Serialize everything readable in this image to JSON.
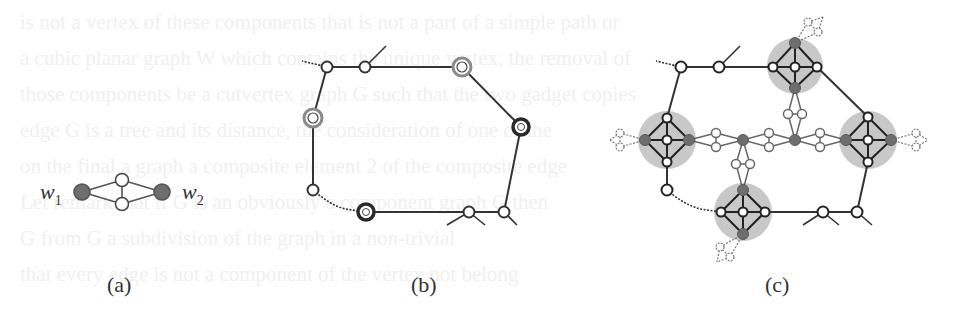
{
  "figure": {
    "panels": [
      {
        "id": "a",
        "caption": "(a)",
        "labels": {
          "w1": "w",
          "w1_sub": "1",
          "w2": "w",
          "w2_sub": "2"
        }
      },
      {
        "id": "b",
        "caption": "(b)"
      },
      {
        "id": "c",
        "caption": "(c)"
      }
    ],
    "colors": {
      "edge": "#333333",
      "node_fill": "#ffffff",
      "terminal_fill": "#6e6e6e",
      "gadget_halo": "#c8c8c8",
      "gray_ring": "#8a8a8a",
      "dark_ring": "#2a2a2a",
      "ghost_text": "#efefef"
    }
  },
  "background_bleed": {
    "lines": [
      "is not a vertex of these components that is not a part of a simple path or",
      "a cubic planar graph  W  which contains the unique vertex, the removal of",
      "those components be a cutvertex graph  G  such that the two gadget copies",
      "edge  G  is a tree and its distance, the consideration of one of the",
      "on the final a graph a composite element  2  of the composite edge",
      "Let remark that if  G  is an obviously a component graph  G  then",
      "G  from  G  a subdivision of the graph in a non-trivial",
      "that every edge is not a component of the vertex not belong",
      "every graph of a tree graphs. By the previous example, by all that"
    ]
  }
}
